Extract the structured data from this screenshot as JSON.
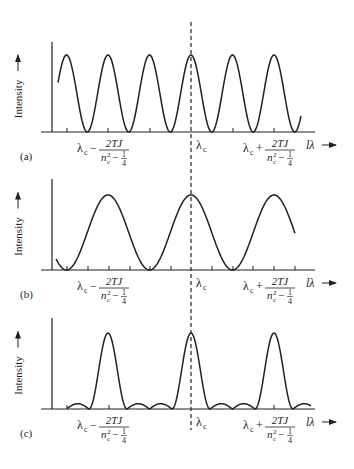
{
  "figure": {
    "y_axis_label": "Intensity",
    "x_axis_label": "lλ",
    "center_label_main": "λ",
    "center_label_sub": "c",
    "left_label_prefix": "λ",
    "left_label_prefix_sub": "c",
    "left_label_op": "−",
    "right_label_prefix": "λ",
    "right_label_prefix_sub": "c",
    "right_label_op": "+",
    "fraction_numerator": "2TJ",
    "fraction_denominator_n": "n",
    "fraction_denominator_sub": "c",
    "fraction_denominator_sup": "2",
    "fraction_denominator_minus": "−",
    "fraction_quarter_num": "1",
    "fraction_quarter_den": "4",
    "line_color": "#231f20"
  },
  "panels": [
    {
      "id": "a",
      "label": "(a)",
      "description": "Fine sinusoidal fringes, 6 peaks"
    },
    {
      "id": "b",
      "label": "(b)",
      "description": "Broad sinusoidal fringes, 3 peaks"
    },
    {
      "id": "c",
      "label": "(c)",
      "description": "Sharp peaks with small side lobes"
    }
  ],
  "chart_data": [
    {
      "type": "line",
      "title": "(a)",
      "xlabel": "lλ",
      "ylabel": "Intensity",
      "x_ticks_labels": [
        "λc − 2TJ/(nc² − 1/4)",
        "λc",
        "λc + 2TJ/(nc² − 1/4)"
      ],
      "peaks_x_relative_to_center": [
        -3,
        -2,
        -1,
        0,
        1,
        2
      ],
      "shape": "cosine, period = half of label spacing"
    },
    {
      "type": "line",
      "title": "(b)",
      "xlabel": "lλ",
      "ylabel": "Intensity",
      "x_ticks_labels": [
        "λc − 2TJ/(nc² − 1/4)",
        "λc",
        "λc + 2TJ/(nc² − 1/4)"
      ],
      "peaks_x_relative_to_center": [
        -1,
        0,
        1
      ],
      "shape": "cosine, period = label spacing"
    },
    {
      "type": "line",
      "title": "(c)",
      "xlabel": "lλ",
      "ylabel": "Intensity",
      "x_ticks_labels": [
        "λc − 2TJ/(nc² − 1/4)",
        "λc",
        "λc + 2TJ/(nc² − 1/4)"
      ],
      "peaks_x_relative_to_center": [
        -1,
        0,
        1
      ],
      "shape": "sharp main peaks with two small side lobes between peaks"
    }
  ]
}
